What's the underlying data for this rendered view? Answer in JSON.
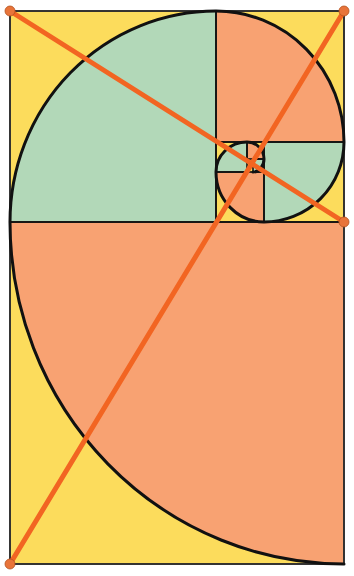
{
  "diagram": {
    "title": "Golden ratio spiral with diagonals",
    "colors": {
      "background": "#fcdc5c",
      "teal": "#b2d8b8",
      "orange": "#f8a272",
      "line": "#f26522",
      "dot": "#e8743a",
      "stroke": "#111111",
      "frame": "#333333"
    },
    "frame": {
      "x": 10,
      "y": 11,
      "width": 334,
      "height": 553
    },
    "squares": [
      {
        "name": "square-1",
        "x": 10,
        "y": 222,
        "w": 334,
        "h": 342,
        "fill": "orange"
      },
      {
        "name": "square-2",
        "x": 10,
        "y": 11,
        "w": 206,
        "h": 211,
        "fill": "teal"
      },
      {
        "name": "square-3",
        "x": 216,
        "y": 11,
        "w": 128,
        "h": 131,
        "fill": "orange"
      },
      {
        "name": "square-4",
        "x": 264,
        "y": 142,
        "w": 80,
        "h": 80,
        "fill": "teal"
      },
      {
        "name": "square-5",
        "x": 216,
        "y": 172,
        "w": 48,
        "h": 50,
        "fill": "orange"
      },
      {
        "name": "square-6",
        "x": 216,
        "y": 142,
        "w": 31,
        "h": 30,
        "fill": "teal"
      },
      {
        "name": "square-7",
        "x": 247,
        "y": 142,
        "w": 17,
        "h": 17,
        "fill": "orange"
      },
      {
        "name": "square-8",
        "x": 253,
        "y": 159,
        "w": 11,
        "h": 13,
        "fill": "teal"
      }
    ],
    "diagonals": [
      {
        "name": "diagonal-top-left-to-right",
        "x1": 10,
        "y1": 11,
        "x2": 344,
        "y2": 222
      },
      {
        "name": "diagonal-bottom-left-to-top-right",
        "x1": 10,
        "y1": 564,
        "x2": 344,
        "y2": 11
      }
    ],
    "endpoints": [
      {
        "name": "endpoint-top-left",
        "x": 10,
        "y": 11
      },
      {
        "name": "endpoint-top-right",
        "x": 344,
        "y": 11
      },
      {
        "name": "endpoint-right-mid",
        "x": 344,
        "y": 222
      },
      {
        "name": "endpoint-bottom-left",
        "x": 10,
        "y": 564
      }
    ]
  }
}
